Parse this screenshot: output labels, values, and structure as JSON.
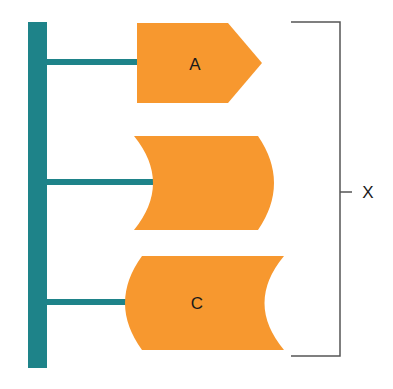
{
  "diagram": {
    "colors": {
      "trunk": "#1e8389",
      "shape_fill": "#f7982f",
      "bracket": "#555555",
      "text": "#1a1a1a"
    },
    "shapes": [
      {
        "id": "A",
        "label": "A",
        "form": "pentagon-arrow"
      },
      {
        "id": "B",
        "label": "",
        "form": "concave-left-convex-right"
      },
      {
        "id": "C",
        "label": "C",
        "form": "convex-left-concave-right"
      }
    ],
    "bracket": {
      "label": "X"
    }
  }
}
